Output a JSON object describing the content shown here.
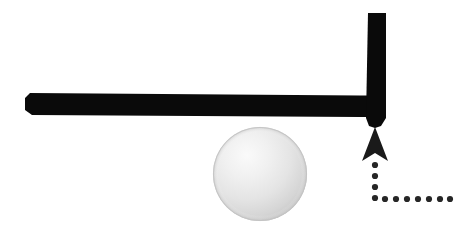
{
  "figure": {
    "kind": "mechanics-diagram",
    "title": "L-shaped beam resting above a sphere with upward force path",
    "background_color": "#ffffff",
    "width": 458,
    "height": 240
  },
  "palette": {
    "beam_color": "#0a0a0a",
    "arrow_color": "#1a1a1a",
    "dot_color": "#262626",
    "sphere_light": "#f2f2f2",
    "sphere_mid": "#e2e2e2",
    "sphere_dark": "#c9c9c9",
    "sphere_edge": "#bdbdbd",
    "background_color": "#ffffff"
  },
  "parts": {
    "horizontal_beam": {
      "name": "horizontal-beam",
      "label": "Horizontal beam",
      "x_start": 25,
      "x_end": 385,
      "y_top": 92,
      "y_bottom": 118,
      "thickness": 26
    },
    "vertical_beam": {
      "name": "vertical-beam",
      "label": "Vertical beam",
      "x_left": 367,
      "x_right": 386,
      "y_top": 13,
      "y_bottom": 124,
      "thickness": 19
    },
    "sphere": {
      "name": "sphere",
      "label": "Sphere",
      "center_x": 260,
      "center_y": 174,
      "radius": 47
    },
    "arrow": {
      "name": "force-arrow",
      "label": "Upward force arrow",
      "tip_x": 375,
      "tip_y": 127,
      "base_y": 161,
      "half_width": 13,
      "direction": "up"
    },
    "dotted_path": {
      "name": "dotted-force-path",
      "label": "Dotted force path",
      "corner_x": 375,
      "corner_y": 198,
      "dot_radius": 3.1,
      "vertical_dots_y": [
        165,
        176,
        187,
        198
      ],
      "horizontal_dots_x": [
        385,
        396,
        407,
        418,
        429,
        440,
        450
      ]
    }
  },
  "annotations": {
    "none_visible": ""
  }
}
